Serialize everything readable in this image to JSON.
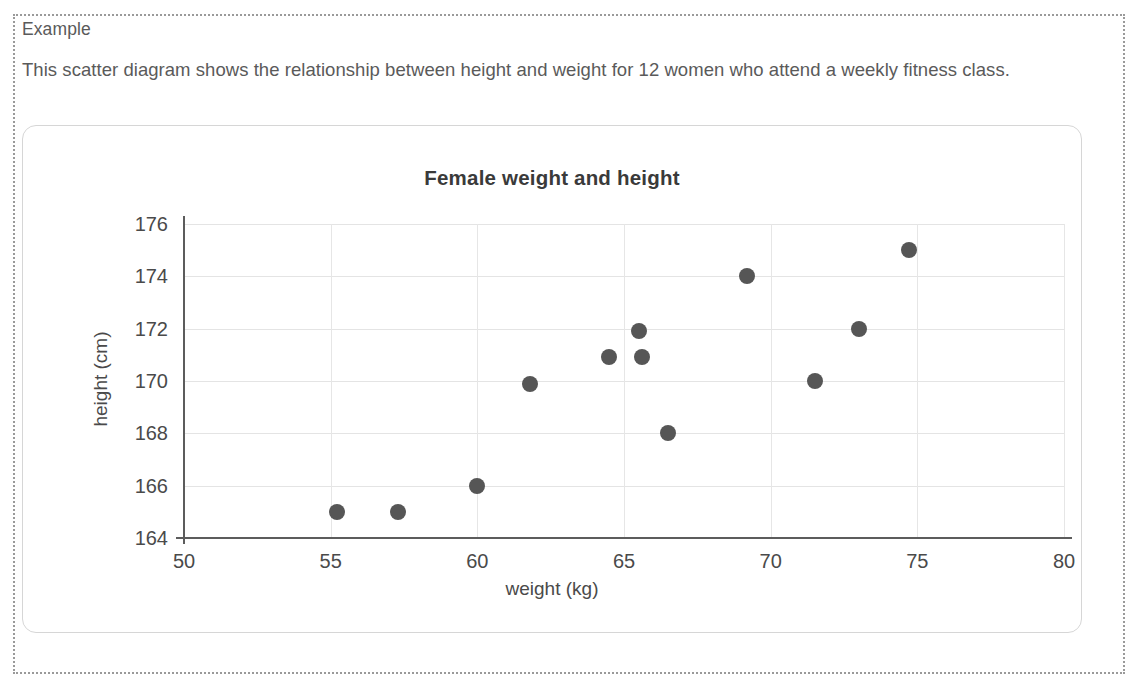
{
  "example": {
    "heading": "Example",
    "description": "This scatter diagram shows the relationship between height and weight for 12 women who attend a weekly fitness class."
  },
  "chart_data": {
    "type": "scatter",
    "title": "Female weight and height",
    "xlabel": "weight (kg)",
    "ylabel": "height (cm)",
    "xlim": [
      50,
      80
    ],
    "ylim": [
      164,
      176
    ],
    "xticks": [
      50,
      55,
      60,
      65,
      70,
      75,
      80
    ],
    "yticks": [
      164,
      166,
      168,
      170,
      172,
      174,
      176
    ],
    "grid": true,
    "legend": false,
    "marker_color": "#565656",
    "points": [
      {
        "x": 55.2,
        "y": 165.0
      },
      {
        "x": 57.3,
        "y": 165.0
      },
      {
        "x": 60.0,
        "y": 166.0
      },
      {
        "x": 61.8,
        "y": 169.9
      },
      {
        "x": 64.5,
        "y": 170.9
      },
      {
        "x": 65.5,
        "y": 171.9
      },
      {
        "x": 65.6,
        "y": 170.9
      },
      {
        "x": 66.5,
        "y": 168.0
      },
      {
        "x": 69.2,
        "y": 174.0
      },
      {
        "x": 71.5,
        "y": 170.0
      },
      {
        "x": 73.0,
        "y": 172.0
      },
      {
        "x": 74.7,
        "y": 175.0
      }
    ]
  }
}
